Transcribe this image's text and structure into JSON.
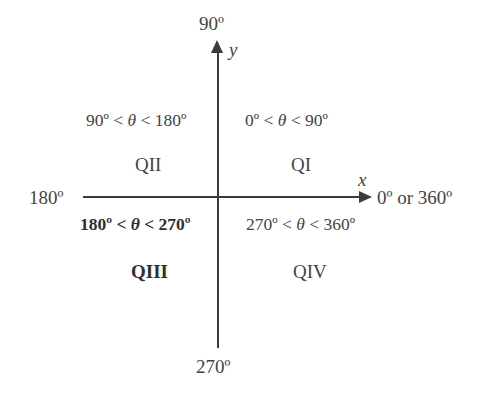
{
  "diagram": {
    "axes": {
      "x_variable": "x",
      "y_variable": "y",
      "color": "#3b3b3b",
      "endpoints": {
        "top": "90º",
        "bottom": "270º",
        "left": "180º",
        "right": "0º or 360º"
      }
    },
    "text_color": "#444444",
    "bold_text_color": "#2e2e2e",
    "quadrants": [
      {
        "name": "QI",
        "label": "QI",
        "range": "0º < θ < 90º",
        "range_min": "0º",
        "range_max": "90º",
        "bold": false,
        "position": "upper-right"
      },
      {
        "name": "QII",
        "label": "QII",
        "range": "90º < θ < 180º",
        "range_min": "90º",
        "range_max": "180º",
        "bold": false,
        "position": "upper-left"
      },
      {
        "name": "QIII",
        "label": "QIII",
        "range": "180º < θ < 270º",
        "range_min": "180º",
        "range_max": "270º",
        "bold": true,
        "position": "lower-left"
      },
      {
        "name": "QIV",
        "label": "QIV",
        "range": "270º < θ < 360º",
        "range_min": "270º",
        "range_max": "360º",
        "bold": false,
        "position": "lower-right"
      }
    ]
  }
}
